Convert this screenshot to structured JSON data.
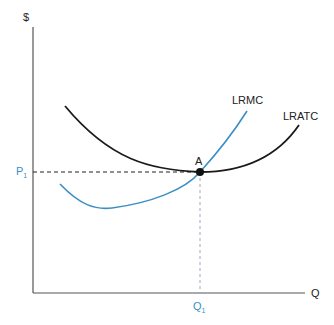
{
  "diagram": {
    "title": "",
    "y_axis_label": "$",
    "x_axis_label": "Q",
    "price_label": "P",
    "price_sub": "1",
    "quantity_label": "Q",
    "quantity_sub": "1",
    "point_label": "A",
    "curves": [
      {
        "name": "LRMC",
        "color": "#3b8fc4"
      },
      {
        "name": "LRATC",
        "color": "#1a1a1a"
      }
    ]
  },
  "colors": {
    "accent_blue": "#3b8fc4",
    "curve_black": "#1a1a1a",
    "axis": "#555555"
  }
}
